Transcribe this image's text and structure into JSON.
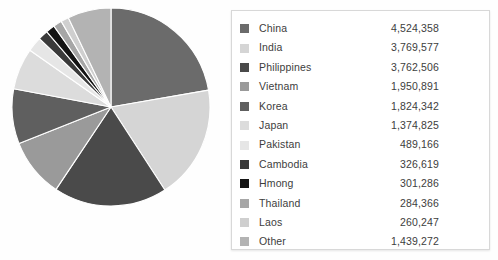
{
  "chart_data": {
    "type": "pie",
    "title": "",
    "legend_position": "right",
    "total": 21908209,
    "categories": [
      "China",
      "India",
      "Philippines",
      "Vietnam",
      "Korea",
      "Japan",
      "Pakistan",
      "Cambodia",
      "Hmong",
      "Thailand",
      "Laos",
      "Other"
    ],
    "values": [
      4524358,
      3769577,
      3762506,
      1950891,
      1824342,
      1374825,
      489166,
      326619,
      301286,
      284366,
      260247,
      1439272
    ],
    "value_labels": [
      "4,524,358",
      "3,769,577",
      "3,762,506",
      "1,950,891",
      "1,824,342",
      "1,374,825",
      "489,166",
      "326,619",
      "301,286",
      "284,366",
      "260,247",
      "1,439,272"
    ],
    "colors": [
      "#6b6b6b",
      "#d5d5d5",
      "#4a4a4a",
      "#9a9a9a",
      "#5f5f5f",
      "#dcdcdc",
      "#e6e6e6",
      "#3a3a3a",
      "#141414",
      "#a6a6a6",
      "#cfcfcf",
      "#b3b3b3"
    ],
    "slice_separator_color": "#ffffff",
    "start_angle_deg": 0,
    "direction": "clockwise"
  },
  "legend": {
    "panel_name": "legend-panel",
    "rows": [
      {
        "label": "China",
        "value": "4,524,358",
        "color": "#6b6b6b"
      },
      {
        "label": "India",
        "value": "3,769,577",
        "color": "#d5d5d5"
      },
      {
        "label": "Philippines",
        "value": "3,762,506",
        "color": "#4a4a4a"
      },
      {
        "label": "Vietnam",
        "value": "1,950,891",
        "color": "#9a9a9a"
      },
      {
        "label": "Korea",
        "value": "1,824,342",
        "color": "#5f5f5f"
      },
      {
        "label": "Japan",
        "value": "1,374,825",
        "color": "#dcdcdc"
      },
      {
        "label": "Pakistan",
        "value": "489,166",
        "color": "#e6e6e6"
      },
      {
        "label": "Cambodia",
        "value": "326,619",
        "color": "#3a3a3a"
      },
      {
        "label": "Hmong",
        "value": "301,286",
        "color": "#141414"
      },
      {
        "label": "Thailand",
        "value": "284,366",
        "color": "#a6a6a6"
      },
      {
        "label": "Laos",
        "value": "260,247",
        "color": "#cfcfcf"
      },
      {
        "label": "Other",
        "value": "1,439,272",
        "color": "#b3b3b3"
      }
    ]
  },
  "pie": {
    "center_x": 100,
    "center_y": 100,
    "radius": 99
  }
}
